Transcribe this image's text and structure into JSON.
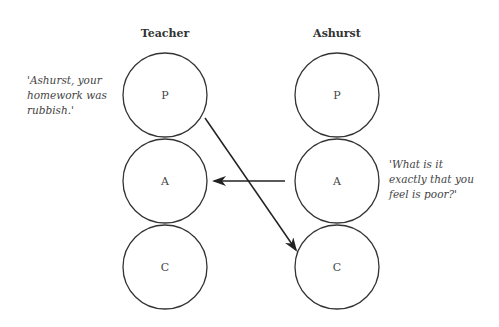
{
  "diagram": {
    "columns": [
      {
        "label": "Teacher",
        "states": [
          "P",
          "A",
          "C"
        ]
      },
      {
        "label": "Ashurst",
        "states": [
          "P",
          "A",
          "C"
        ]
      }
    ],
    "quotes": {
      "teacher": [
        "'Ashurst, your",
        "homework was",
        "rubbish.'"
      ],
      "ashurst": [
        "'What is it",
        "exactly that you",
        "feel is poor?'"
      ]
    },
    "arrows": [
      {
        "from": "Teacher.P",
        "to": "Ashurst.C"
      },
      {
        "from": "Ashurst.A",
        "to": "Teacher.A"
      }
    ]
  }
}
